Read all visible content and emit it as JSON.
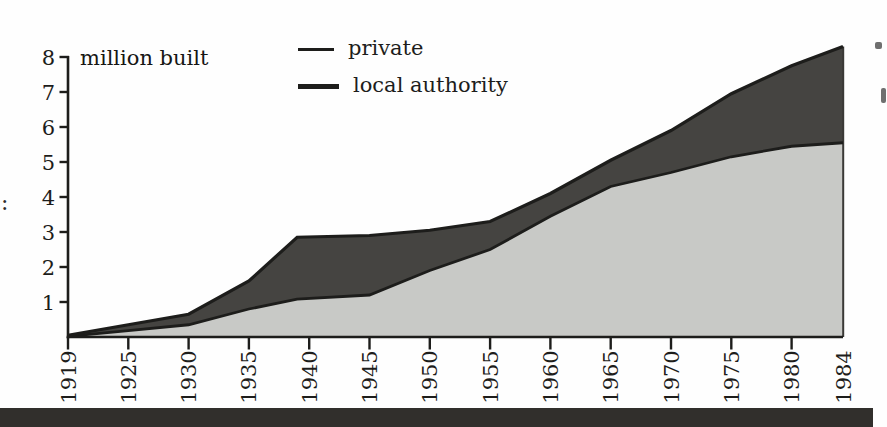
{
  "chart": {
    "title": "million built",
    "legend": [
      {
        "label": "private",
        "swatch": "thin-line"
      },
      {
        "label": "local authority",
        "swatch": "thick-line"
      }
    ]
  },
  "chart_data": {
    "type": "area",
    "title": "million built",
    "x": [
      1919,
      1925,
      1930,
      1935,
      1939,
      1945,
      1950,
      1955,
      1960,
      1965,
      1970,
      1975,
      1980,
      1984
    ],
    "series": [
      {
        "name": "private",
        "values": [
          0.05,
          0.35,
          0.65,
          1.6,
          2.85,
          2.9,
          3.05,
          3.3,
          4.1,
          5.05,
          5.9,
          6.95,
          7.75,
          8.3
        ],
        "line_color": "#1d1d1b",
        "fill_color": "#454441"
      },
      {
        "name": "local authority",
        "values": [
          0.02,
          0.18,
          0.35,
          0.8,
          1.08,
          1.2,
          1.9,
          2.5,
          3.45,
          4.3,
          4.7,
          5.15,
          5.45,
          5.55
        ],
        "line_color": "#1d1d1b",
        "fill_color": "#c8c9c6"
      }
    ],
    "xticks": [
      1919,
      1925,
      1930,
      1935,
      1940,
      1945,
      1950,
      1955,
      1960,
      1965,
      1970,
      1975,
      1980,
      1984
    ],
    "yticks": [
      1,
      2,
      3,
      4,
      5,
      6,
      7,
      8
    ],
    "xlim": [
      1919,
      1984
    ],
    "ylim": [
      0,
      8.5
    ],
    "grid": false,
    "legend_position": "top-center",
    "fill_mode": "overlapping"
  },
  "artifacts": {
    "left_margin_text": ":"
  }
}
